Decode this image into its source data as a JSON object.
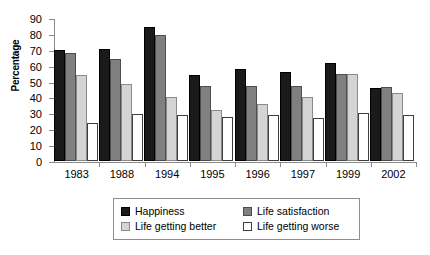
{
  "chart_data": {
    "type": "bar",
    "title": "",
    "xlabel": "",
    "ylabel": "Percentage",
    "ylim": [
      0,
      90
    ],
    "ytick_step": 10,
    "yticks": [
      0,
      10,
      20,
      30,
      40,
      50,
      60,
      70,
      80,
      90
    ],
    "grid": false,
    "legend_position": "bottom",
    "categories": [
      "1983",
      "1988",
      "1994",
      "1995",
      "1996",
      "1997",
      "1999",
      "2002"
    ],
    "series": [
      {
        "name": "Happiness",
        "color": "#1a1a1a",
        "values": [
          70,
          70.5,
          84.5,
          54,
          58,
          56,
          62,
          46
        ]
      },
      {
        "name": "Life satisfaction",
        "color": "#808080",
        "values": [
          68,
          64,
          79.5,
          47,
          47.5,
          47.5,
          55,
          46.5
        ]
      },
      {
        "name": "Life getting better",
        "color": "#d4d4d4",
        "values": [
          54,
          48.5,
          40.5,
          32,
          36,
          40,
          55,
          43
        ]
      },
      {
        "name": "Life getting worse",
        "color": "#ffffff",
        "values": [
          24,
          29.5,
          29,
          28,
          29,
          27,
          30,
          29
        ]
      }
    ]
  },
  "axis": {
    "y_title": "Percentage"
  }
}
